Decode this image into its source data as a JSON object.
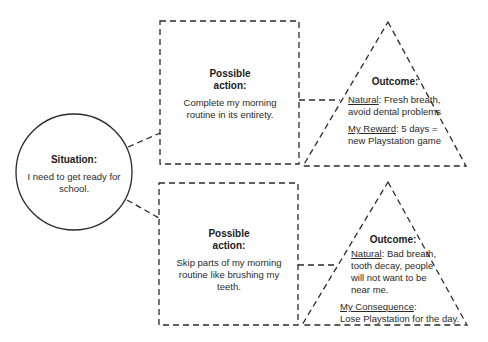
{
  "situation": {
    "title": "Situation:",
    "text": "I need to get ready for school."
  },
  "branches": [
    {
      "action": {
        "title": "Possible action:",
        "text": "Complete my morning routine in its entirety."
      },
      "outcome": {
        "title": "Outcome:",
        "items": [
          {
            "label": "Natural",
            "text": ": Fresh breath, avoid dental problems"
          },
          {
            "label": "My Reward",
            "text": ": 5 days = new Playstation game"
          }
        ]
      }
    },
    {
      "action": {
        "title": "Possible action:",
        "text": "Skip parts of my morning routine like brushing my teeth."
      },
      "outcome": {
        "title": "Outcome:",
        "items": [
          {
            "label": "Natural",
            "text": ": Bad breath, tooth decay, people will not want to be near me."
          },
          {
            "label": "My Consequence",
            "text": ":"
          },
          {
            "label": "",
            "text": "Lose Playstation for the day."
          }
        ]
      }
    }
  ],
  "colors": {
    "stroke": "#2a2a2a",
    "background": "#ffffff"
  }
}
